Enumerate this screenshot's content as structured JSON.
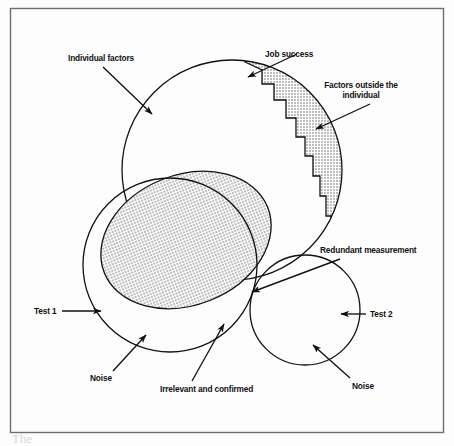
{
  "figure": {
    "type": "venn-diagram",
    "background_color": "#fdfdfd",
    "frame": {
      "stroke": "#6e6e6e",
      "x": 10.5,
      "y": 8.5,
      "width": 433,
      "height": 424
    },
    "shapes": {
      "job_success_circle": {
        "cx": 232,
        "cy": 170,
        "r": 110,
        "stroke": "#111111",
        "fill": "none"
      },
      "individual_ellipse": {
        "cx": 186,
        "cy": 240,
        "rx": 88,
        "ry": 65,
        "rotation": -22,
        "fill": "#c9c9c9",
        "stroke": "#111111"
      },
      "test1_circle": {
        "cx": 170,
        "cy": 265,
        "r": 87,
        "stroke": "#111111",
        "fill": "none"
      },
      "test2_circle": {
        "cx": 305,
        "cy": 310,
        "r": 55,
        "stroke": "#111111",
        "fill": "none"
      },
      "redundant_overlap": {
        "fill": "#9a9a9a"
      },
      "outside_band": {
        "fill": "#c9c9c9",
        "stroke": "#111111",
        "description": "jagged staircase band along upper-right arc of the job success circle"
      }
    },
    "labels": [
      {
        "id": "individual-factors",
        "text": "Individual factors",
        "x": 68,
        "y": 61,
        "anchor": "start"
      },
      {
        "id": "job-success",
        "text": "Job success",
        "x": 263,
        "y": 57,
        "anchor": "start"
      },
      {
        "id": "factors-outside-the",
        "text": "Factors outside the",
        "x": 360,
        "y": 88,
        "anchor": "middle"
      },
      {
        "id": "factors-outside-individual",
        "text": "individual",
        "x": 360,
        "y": 98,
        "anchor": "middle"
      },
      {
        "id": "redundant-measurement",
        "text": "Redundant measurement",
        "x": 320,
        "y": 253,
        "anchor": "start"
      },
      {
        "id": "test-1",
        "text": "Test 1",
        "x": 34,
        "y": 313,
        "anchor": "start"
      },
      {
        "id": "test-2",
        "text": "Test 2",
        "x": 368,
        "y": 317,
        "anchor": "start"
      },
      {
        "id": "noise-left",
        "text": "Noise",
        "x": 90,
        "y": 380,
        "anchor": "start"
      },
      {
        "id": "noise-right",
        "text": "Noise",
        "x": 352,
        "y": 388,
        "anchor": "start"
      },
      {
        "id": "irrelevant-and-confirmed",
        "text": "Irrelevant and confirmed",
        "x": 160,
        "y": 391,
        "anchor": "start"
      }
    ],
    "arrows": [
      {
        "id": "arrow-individual-factors",
        "from": [
          103,
          67
        ],
        "to": [
          152,
          114
        ]
      },
      {
        "id": "arrow-job-success",
        "from": [
          278,
          62
        ],
        "to": [
          248,
          77
        ]
      },
      {
        "id": "arrow-factors-outside",
        "from": [
          368,
          103
        ],
        "to": [
          316,
          129
        ]
      },
      {
        "id": "arrow-redundant-measurement",
        "from": [
          330,
          258
        ],
        "to": [
          252,
          292
        ]
      },
      {
        "id": "arrow-test-1",
        "from": [
          62,
          311
        ],
        "to": [
          99,
          311
        ]
      },
      {
        "id": "arrow-test-2",
        "from": [
          364,
          314
        ],
        "to": [
          340,
          314
        ]
      },
      {
        "id": "arrow-noise-left",
        "from": [
          113,
          371
        ],
        "to": [
          145,
          335
        ]
      },
      {
        "id": "arrow-noise-right",
        "from": [
          350,
          378
        ],
        "to": [
          312,
          345
        ]
      },
      {
        "id": "arrow-irrelevant-confirmed",
        "from": [
          192,
          381
        ],
        "to": [
          224,
          326
        ]
      }
    ],
    "caption_partial": "The"
  }
}
